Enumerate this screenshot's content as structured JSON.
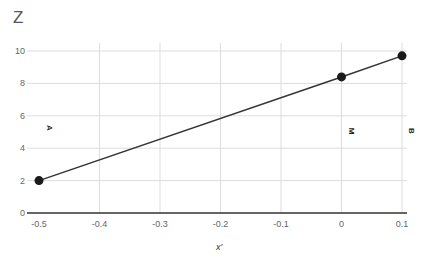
{
  "chart_data": {
    "type": "line",
    "title": "Z",
    "xlabel": "x'",
    "ylabel": "",
    "xlim": [
      -0.5,
      0.1
    ],
    "ylim": [
      0,
      10
    ],
    "grid": true,
    "legend": "none",
    "x_ticks": [
      "-0.5",
      "-0.4",
      "-0.3",
      "-0.2",
      "-0.1",
      "0",
      "0.1"
    ],
    "y_ticks": [
      "0",
      "2",
      "4",
      "6",
      "8",
      "10"
    ],
    "series": [
      {
        "name": "Z",
        "color": "#333333",
        "points": [
          {
            "x": -0.5,
            "y": 2.0,
            "label": "A"
          },
          {
            "x": 0.0,
            "y": 8.4,
            "label": "M"
          },
          {
            "x": 0.1,
            "y": 9.7,
            "label": "B"
          }
        ]
      }
    ]
  },
  "labels": {
    "title": "Z",
    "xlabel": "x'",
    "point_a": "A",
    "point_m": "M",
    "point_b": "B"
  },
  "colors": {
    "line": "#333333",
    "marker": "#1a1a1a",
    "grid": "#dddddd",
    "axis": "#333333"
  }
}
